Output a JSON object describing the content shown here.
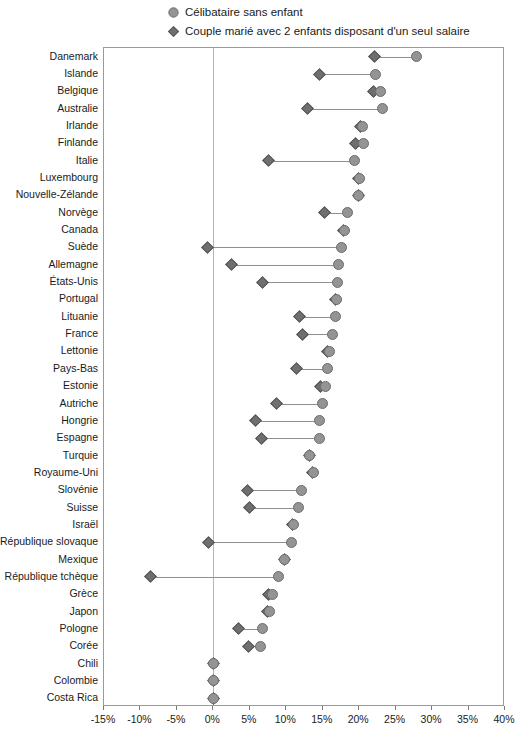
{
  "chart_data": {
    "type": "scatter",
    "subtype": "dumbbell",
    "title": "",
    "xlabel": "",
    "ylabel": "",
    "xlim": [
      -15,
      40
    ],
    "xticks": [
      -15,
      -10,
      -5,
      0,
      5,
      10,
      15,
      20,
      25,
      30,
      35,
      40
    ],
    "xtick_labels": [
      "-15%",
      "-10%",
      "-5%",
      "0%",
      "5%",
      "10%",
      "15%",
      "20%",
      "25%",
      "30%",
      "35%",
      "40%"
    ],
    "grid": false,
    "legend_position": "top",
    "legend": [
      {
        "label": "Célibataire sans enfant",
        "marker": "circle",
        "color": "#949494"
      },
      {
        "label": "Couple marié avec 2 enfants disposant d'un seul salaire",
        "marker": "diamond",
        "color": "#6f6f6f"
      }
    ],
    "categories": [
      "Danemark",
      "Islande",
      "Belgique",
      "Australie",
      "Irlande",
      "Finlande",
      "Italie",
      "Luxembourg",
      "Nouvelle-Zélande",
      "Norvège",
      "Canada",
      "Suède",
      "Allemagne",
      "États-Unis",
      "Portugal",
      "Lituanie",
      "France",
      "Lettonie",
      "Pays-Bas",
      "Estonie",
      "Autriche",
      "Hongrie",
      "Espagne",
      "Turquie",
      "Royaume-Uni",
      "Slovénie",
      "Suisse",
      "Israël",
      "République slovaque",
      "Mexique",
      "République tchèque",
      "Grèce",
      "Japon",
      "Pologne",
      "Corée",
      "Chili",
      "Colombie",
      "Costa Rica"
    ],
    "series": [
      {
        "name": "Célibataire sans enfant",
        "marker": "circle",
        "color": "#949494",
        "values": [
          27.8,
          22.2,
          22.9,
          23.2,
          20.4,
          20.6,
          19.4,
          20.0,
          19.9,
          18.4,
          18.0,
          17.6,
          17.1,
          17.0,
          16.9,
          16.7,
          16.4,
          15.9,
          15.7,
          15.4,
          15.0,
          14.6,
          14.5,
          13.2,
          13.7,
          12.1,
          11.7,
          11.0,
          10.7,
          9.8,
          8.9,
          8.1,
          7.7,
          6.8,
          6.5,
          0.0,
          0.0,
          0.0
        ]
      },
      {
        "name": "Couple marié avec 2 enfants disposant d'un seul salaire",
        "marker": "diamond",
        "color": "#6f6f6f",
        "values": [
          22.1,
          14.6,
          22.0,
          12.9,
          20.2,
          19.5,
          7.6,
          19.9,
          19.9,
          15.3,
          17.9,
          -0.8,
          2.5,
          6.7,
          16.8,
          11.8,
          12.2,
          15.6,
          11.4,
          14.7,
          8.6,
          5.8,
          6.6,
          13.2,
          13.6,
          4.7,
          4.9,
          10.9,
          -0.6,
          9.8,
          -8.6,
          7.5,
          7.4,
          3.5,
          4.8,
          0.0,
          0.0,
          0.0
        ]
      }
    ]
  }
}
